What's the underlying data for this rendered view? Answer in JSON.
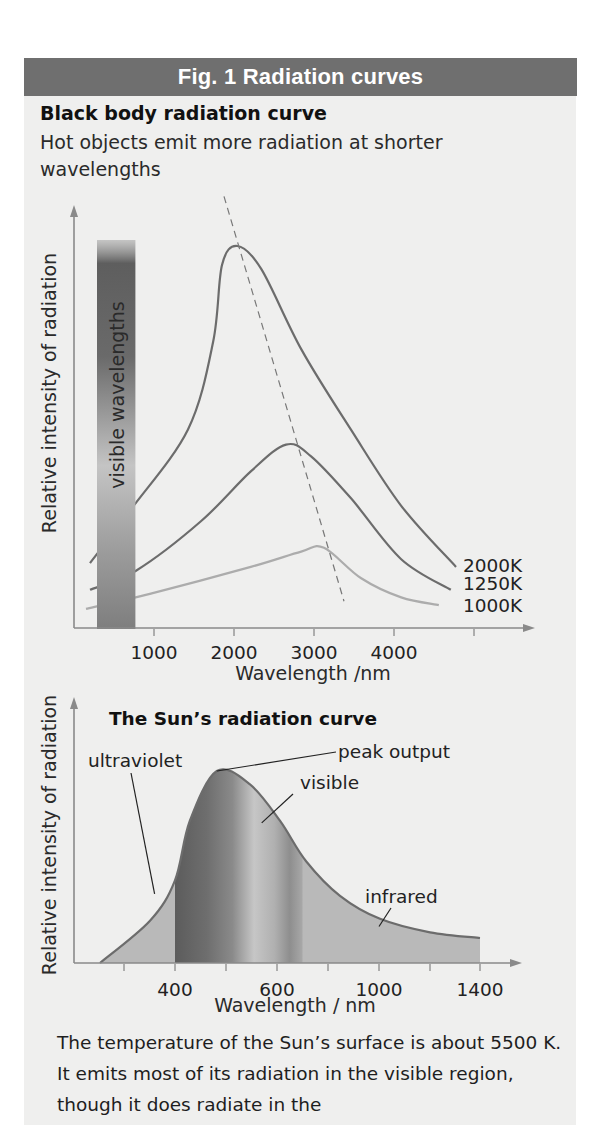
{
  "figure": {
    "header": "Fig. 1 Radiation curves",
    "heading": "Black body radiation curve",
    "subtext": "Hot objects emit more radiation at shorter wavelengths",
    "body_text": "The temperature of the Sun’s surface is about 5500 K. It emits most of its radiation in the visible region, though it does radiate in the"
  },
  "colors": {
    "header_bg": "#6f6f6f",
    "panel_bg": "#efefee",
    "curve_dark": "#6c6c6c",
    "curve_light": "#acacac",
    "axis": "#8a8a8a"
  },
  "chart_data": [
    {
      "type": "line",
      "title": "Black body radiation curve",
      "xlabel": "Wavelength /nm",
      "ylabel": "Relative intensity of radiation",
      "xlim": [
        0,
        5500
      ],
      "ylim": [
        0,
        1.2
      ],
      "xticks": [
        1000,
        2000,
        3000,
        4000,
        5000
      ],
      "xtick_labels": [
        "1000",
        "2000",
        "3000",
        "4000",
        ""
      ],
      "grid": false,
      "band": {
        "label": "visible wavelengths",
        "x_range": [
          300,
          780
        ]
      },
      "series": [
        {
          "name": "2000K",
          "label": "2000K",
          "peak_nm": 2000,
          "x": [
            200,
            710,
            1425,
            1740,
            1850,
            2040,
            2340,
            2840,
            3460,
            4090,
            4775
          ],
          "y": [
            0.17,
            0.31,
            0.52,
            0.75,
            0.95,
            1.0,
            0.94,
            0.73,
            0.52,
            0.32,
            0.16
          ]
        },
        {
          "name": "1250K",
          "label": "1250K",
          "peak_nm": 2650,
          "x": [
            200,
            775,
            1590,
            2210,
            2650,
            2960,
            3460,
            4090,
            4710
          ],
          "y": [
            0.1,
            0.15,
            0.28,
            0.41,
            0.48,
            0.45,
            0.34,
            0.18,
            0.1
          ]
        },
        {
          "name": "1000K",
          "label": "1000K",
          "peak_nm": 3100,
          "x": [
            150,
            960,
            2210,
            2840,
            3125,
            3590,
            4090,
            4560
          ],
          "y": [
            0.05,
            0.09,
            0.16,
            0.2,
            0.21,
            0.13,
            0.08,
            0.06
          ]
        }
      ],
      "peak_line": {
        "style": "dashed",
        "x": [
          1875,
          3375
        ],
        "y": [
          1.13,
          0.07
        ]
      }
    },
    {
      "type": "area",
      "title": "The Sun’s radiation curve",
      "xlabel": "Wavelength / nm",
      "ylabel": "Relative intensity of radiation",
      "xticks": [
        300,
        400,
        500,
        600,
        800,
        1000,
        1200,
        1400
      ],
      "xtick_labels": [
        "",
        "400",
        "",
        "600",
        "",
        "1000",
        "",
        "1400"
      ],
      "ylim": [
        0,
        1.1
      ],
      "grid": false,
      "regions": [
        {
          "name": "ultraviolet",
          "x_range": [
            253,
            400
          ]
        },
        {
          "name": "visible",
          "x_range": [
            400,
            700
          ]
        },
        {
          "name": "infrared",
          "x_range": [
            700,
            1400
          ]
        }
      ],
      "series": [
        {
          "name": "Sun",
          "x": [
            253,
            351,
            400,
            429,
            482,
            547,
            612,
            714,
            847,
            1004,
            1200,
            1400
          ],
          "y": [
            0,
            0.22,
            0.43,
            0.74,
            1.0,
            0.93,
            0.74,
            0.53,
            0.35,
            0.23,
            0.16,
            0.13
          ]
        }
      ],
      "annotations": [
        {
          "text": "peak output",
          "target_x": 482,
          "target_y": 1.0
        },
        {
          "text": "visible",
          "target_x": 570,
          "target_y": 0.73
        },
        {
          "text": "ultraviolet",
          "target_x": 360,
          "target_y": 0.36
        },
        {
          "text": "infrared",
          "target_x": 1000,
          "target_y": 0.19
        }
      ]
    }
  ]
}
